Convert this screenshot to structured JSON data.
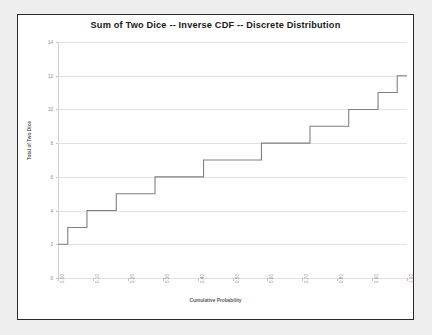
{
  "chart_data": {
    "type": "line",
    "title": "Sum of Two Dice -- Inverse CDF -- Discrete Distribution",
    "xlabel": "Cumulative Probability",
    "ylabel": "Total of Two Dice",
    "xlim": [
      0.0,
      1.0
    ],
    "ylim": [
      0,
      14
    ],
    "grid": true,
    "legend": "none",
    "style": "step",
    "x_tick_labels": [
      "0.00",
      "0.10",
      "0.20",
      "0.30",
      "0.40",
      "0.50",
      "0.60",
      "0.70",
      "0.80",
      "0.90",
      "1.00"
    ],
    "x_tick_values": [
      0.0,
      0.1,
      0.2,
      0.3,
      0.4,
      0.5,
      0.6,
      0.7,
      0.8,
      0.9,
      1.0
    ],
    "y_tick_labels": [
      "0",
      "2",
      "4",
      "6",
      "8",
      "10",
      "12",
      "14"
    ],
    "y_tick_values": [
      0,
      2,
      4,
      6,
      8,
      10,
      12,
      14
    ],
    "series": [
      {
        "name": "Inverse CDF",
        "color": "#808080",
        "x": [
          0.0,
          0.028,
          0.028,
          0.083,
          0.083,
          0.167,
          0.167,
          0.278,
          0.278,
          0.417,
          0.417,
          0.583,
          0.583,
          0.722,
          0.722,
          0.833,
          0.833,
          0.917,
          0.917,
          0.972,
          0.972,
          1.0
        ],
        "y": [
          2,
          2,
          3,
          3,
          4,
          4,
          5,
          5,
          6,
          6,
          7,
          7,
          8,
          8,
          9,
          9,
          10,
          10,
          11,
          11,
          12,
          12
        ]
      }
    ],
    "step_breakpoints": [
      {
        "cumulative_probability": 0.028,
        "total": 2
      },
      {
        "cumulative_probability": 0.083,
        "total": 3
      },
      {
        "cumulative_probability": 0.167,
        "total": 4
      },
      {
        "cumulative_probability": 0.278,
        "total": 5
      },
      {
        "cumulative_probability": 0.417,
        "total": 6
      },
      {
        "cumulative_probability": 0.583,
        "total": 7
      },
      {
        "cumulative_probability": 0.722,
        "total": 8
      },
      {
        "cumulative_probability": 0.833,
        "total": 9
      },
      {
        "cumulative_probability": 0.917,
        "total": 10
      },
      {
        "cumulative_probability": 0.972,
        "total": 11
      },
      {
        "cumulative_probability": 1.0,
        "total": 12
      }
    ]
  }
}
